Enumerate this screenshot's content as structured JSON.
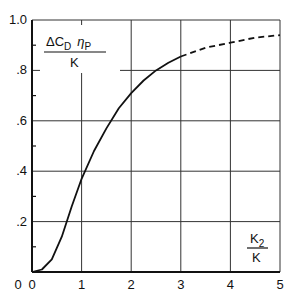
{
  "chart_data": {
    "type": "line",
    "title": "",
    "ylabel": "ΔC_D η_P / K",
    "xlabel": "K_2 / K",
    "ylabel_parts": {
      "num": "ΔC",
      "num_sub": "D",
      "eta": "η",
      "eta_sub": "P",
      "den": "K"
    },
    "xlabel_parts": {
      "num": "K",
      "num_sub": "2",
      "den": "K"
    },
    "xlim": [
      0,
      5
    ],
    "ylim": [
      0,
      1.0
    ],
    "xticks": [
      "0",
      "1",
      "2",
      "3",
      "4",
      "5"
    ],
    "yticks": [
      "0",
      ".2",
      ".4",
      ".6",
      ".8",
      "1.0"
    ],
    "grid": true,
    "series": [
      {
        "name": "solid",
        "style": "solid",
        "x": [
          0,
          0.2,
          0.4,
          0.6,
          0.8,
          1.0,
          1.25,
          1.5,
          1.75,
          2.0,
          2.25,
          2.5,
          2.75,
          3.0
        ],
        "y": [
          0,
          0.01,
          0.05,
          0.14,
          0.26,
          0.37,
          0.48,
          0.57,
          0.65,
          0.71,
          0.76,
          0.8,
          0.83,
          0.855
        ]
      },
      {
        "name": "dashed",
        "style": "dashed",
        "x": [
          3.0,
          3.5,
          4.0,
          4.5,
          5.0
        ],
        "y": [
          0.855,
          0.89,
          0.91,
          0.93,
          0.94
        ]
      }
    ]
  }
}
